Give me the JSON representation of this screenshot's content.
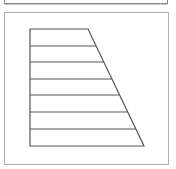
{
  "panels": {
    "top": {
      "label": ""
    },
    "main": {
      "label": ""
    }
  },
  "figure": {
    "shape": "right-trapezoid",
    "stroke_color": "#555555",
    "top_left": [
      30,
      29
    ],
    "top_right": [
      88,
      29
    ],
    "bottom_right": [
      144,
      146
    ],
    "bottom_left": [
      30,
      146
    ],
    "horizontal_divisions": 7,
    "line_y": [
      29,
      46,
      62,
      79,
      95,
      112,
      129,
      146
    ]
  }
}
